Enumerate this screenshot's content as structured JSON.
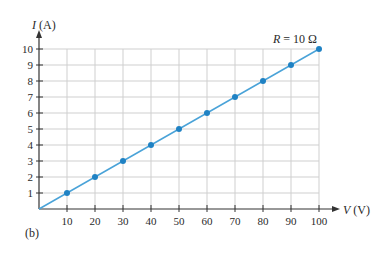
{
  "chart_data": {
    "type": "line",
    "title": "",
    "panel_label": "(b)",
    "annotation": "R = 10 Ω",
    "annotation_parts": {
      "var": "R",
      "rest": " = 10 Ω"
    },
    "xlabel": "V (V)",
    "xlabel_parts": {
      "var": "V",
      "unit": " (V)"
    },
    "ylabel": "I (A)",
    "ylabel_parts": {
      "var": "I",
      "unit": " (A)"
    },
    "x": [
      0,
      10,
      20,
      30,
      40,
      50,
      60,
      70,
      80,
      90,
      100
    ],
    "series": [
      {
        "name": "R = 10 Ω",
        "values": [
          0,
          1,
          2,
          3,
          4,
          5,
          6,
          7,
          8,
          9,
          10
        ],
        "markers_at": [
          10,
          20,
          30,
          40,
          50,
          60,
          70,
          80,
          90,
          100
        ]
      }
    ],
    "xticks": [
      "10",
      "20",
      "30",
      "40",
      "50",
      "60",
      "70",
      "80",
      "90",
      "100"
    ],
    "yticks": [
      "1",
      "2",
      "3",
      "4",
      "5",
      "6",
      "7",
      "8",
      "9",
      "10"
    ],
    "xlim": [
      0,
      100
    ],
    "ylim": [
      0,
      10
    ],
    "grid": true,
    "legend": "none",
    "colors": {
      "line": "#4aa3d8",
      "marker": "#1f82c4",
      "grid": "#cfcfcf",
      "axis": "#333333"
    }
  }
}
